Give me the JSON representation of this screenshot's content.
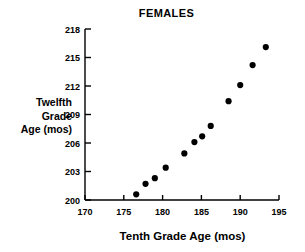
{
  "chart_data": {
    "type": "scatter",
    "title": "FEMALES",
    "xlabel": "Tenth Grade Age (mos)",
    "ylabel": "Twelfth\nGrade\nAge (mos)",
    "xlim": [
      170,
      195
    ],
    "ylim": [
      200,
      218
    ],
    "xticks": [
      170,
      175,
      180,
      185,
      190,
      195
    ],
    "yticks": [
      200,
      203,
      206,
      209,
      212,
      215,
      218
    ],
    "grid": false,
    "legend": null,
    "marker": "filled-circle",
    "marker_color": "#000000",
    "series": [
      {
        "name": "Females",
        "points": [
          [
            176.6,
            200.6
          ],
          [
            177.8,
            201.7
          ],
          [
            179.0,
            202.3
          ],
          [
            180.4,
            203.4
          ],
          [
            182.8,
            204.9
          ],
          [
            184.1,
            206.1
          ],
          [
            185.1,
            206.7
          ],
          [
            186.2,
            207.8
          ],
          [
            188.5,
            210.4
          ],
          [
            190.0,
            212.1
          ],
          [
            191.6,
            214.2
          ],
          [
            193.3,
            216.1
          ]
        ]
      }
    ]
  },
  "axis": {
    "x_tick_labels": [
      "170",
      "175",
      "180",
      "185",
      "190",
      "195"
    ],
    "y_tick_labels": [
      "200",
      "203",
      "206",
      "209",
      "212",
      "215",
      "218"
    ]
  }
}
